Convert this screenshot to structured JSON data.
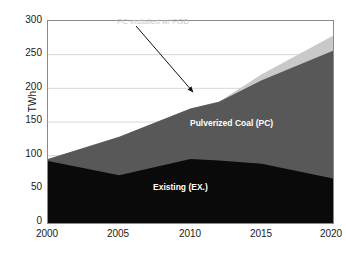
{
  "chart_data": {
    "type": "area",
    "title": "",
    "subtitle": "",
    "xlabel": "",
    "ylabel": "TWh",
    "xlim": [
      2000,
      2020
    ],
    "ylim": [
      0,
      300
    ],
    "yticks": [
      0,
      50,
      100,
      150,
      200,
      250,
      300
    ],
    "xticks": [
      2000,
      2005,
      2010,
      2015,
      2020
    ],
    "grid": "horizontal",
    "legend_position": "in-plot-annotations",
    "stacked": true,
    "x": [
      2000,
      2005,
      2010,
      2012,
      2015,
      2020
    ],
    "series": [
      {
        "name": "Existing (EX.)",
        "color": "#0a0a0a",
        "values": [
          92,
          71,
          95,
          93,
          88,
          66
        ],
        "cumulative": [
          92,
          71,
          95,
          93,
          88,
          66
        ]
      },
      {
        "name": "Pulverized Coal (PC)",
        "color": "#585858",
        "values": [
          3,
          57,
          75,
          87,
          124,
          190
        ],
        "cumulative": [
          95,
          128,
          170,
          180,
          212,
          256
        ]
      },
      {
        "name": "PC installed w/ FGD",
        "color": "#c9c9c9",
        "values": [
          0,
          0,
          0,
          0,
          9,
          22
        ],
        "cumulative": [
          95,
          128,
          170,
          180,
          221,
          278
        ]
      }
    ],
    "annotations": [
      {
        "text": "PC installed w/ FGD",
        "color": "#c8c8c8",
        "arrow_from": [
          2006.2,
          289
        ],
        "arrow_to": [
          2012.1,
          182
        ]
      },
      {
        "text": "Pulverized Coal (PC)",
        "color": "#ffffff",
        "at": [
          2014.5,
          158
        ]
      },
      {
        "text": "Existing (EX.)",
        "color": "#ffffff",
        "at": [
          2010.0,
          60
        ]
      }
    ]
  },
  "axis": {
    "y_title": "TWh",
    "y_tick_labels": [
      "300",
      "250",
      "200",
      "150",
      "100",
      "50",
      "0"
    ],
    "x_tick_labels": [
      "2000",
      "2005",
      "2010",
      "2015",
      "2020"
    ]
  },
  "labels": {
    "pulverized_coal": "Pulverized Coal (PC)",
    "existing": "Existing (EX.)",
    "fgd": "PC installed w/ FGD"
  },
  "colors": {
    "existing": "#0a0a0a",
    "pulverized_coal": "#585858",
    "fgd": "#c9c9c9",
    "grid": "#d8d8d8",
    "frame": "#8a8a8a",
    "text": "#1a1a1a",
    "background": "#ffffff"
  }
}
